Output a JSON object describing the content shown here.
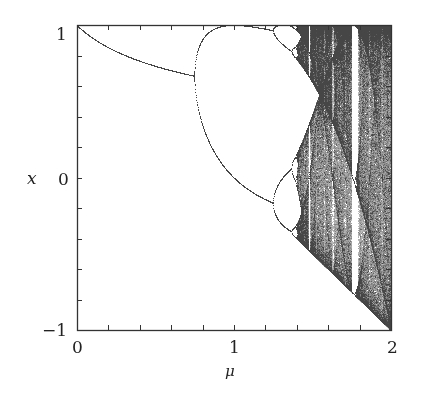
{
  "chart_data": {
    "type": "scatter",
    "title": "",
    "map": "x -> 1 - mu*x^2",
    "xlabel": "μ",
    "ylabel": "x",
    "xlim": [
      0,
      2
    ],
    "ylim": [
      -1,
      1
    ],
    "x_tick_labels": [
      "0",
      "1",
      "2"
    ],
    "x_tick_values": [
      0,
      1,
      2
    ],
    "y_tick_labels": [
      "1",
      "0",
      "−1"
    ],
    "y_tick_values": [
      1,
      0,
      -1
    ],
    "minor_tick_step_x": 0.2,
    "minor_tick_step_y": 0.2,
    "grid": false,
    "legend": null,
    "annotations": {
      "fixed_point_start": [
        0,
        1
      ],
      "first_period_doubling_mu": 0.75,
      "second_period_doubling_mu": 1.25,
      "onset_of_chaos_mu": 1.401,
      "period_3_window_mu": 1.75
    },
    "colors": {
      "curve": "#444444",
      "chaos": "#7a7a7a",
      "axes": "#333333"
    }
  },
  "axes": {
    "x_label": "μ",
    "y_label": "x",
    "x_ticks": [
      "0",
      "1",
      "2"
    ],
    "y_ticks": [
      "1",
      "0",
      "−1"
    ]
  }
}
